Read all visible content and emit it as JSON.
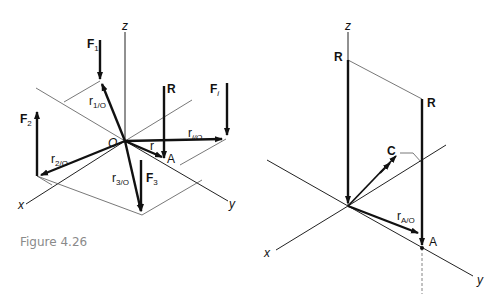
{
  "caption": "Figure 4.26",
  "left_diagram": {
    "axes": {
      "x": "x",
      "y": "y",
      "z": "z"
    },
    "origin_label": "O",
    "point_label": "A",
    "forces": [
      {
        "name": "F",
        "sub": "1"
      },
      {
        "name": "F",
        "sub": "2"
      },
      {
        "name": "F",
        "sub": "3"
      },
      {
        "name": "F",
        "sub": "i"
      },
      {
        "name": "R",
        "sub": ""
      }
    ],
    "position_vectors": [
      {
        "name": "r",
        "sub": "1/O"
      },
      {
        "name": "r",
        "sub": "2/O"
      },
      {
        "name": "r",
        "sub": "3/O"
      },
      {
        "name": "r",
        "sub": "i/O"
      },
      {
        "name": "r",
        "sub": ""
      }
    ]
  },
  "right_diagram": {
    "axes": {
      "x": "x",
      "y": "y",
      "z": "z"
    },
    "resultant_top": "R",
    "resultant_shifted": "R",
    "couple": "C",
    "position_vector": {
      "name": "r",
      "sub": "A/O"
    },
    "point_label": "A"
  }
}
